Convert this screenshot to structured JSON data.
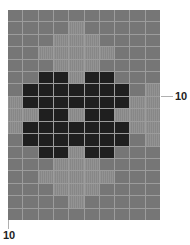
{
  "figure": {
    "rows": 17,
    "cols": 10,
    "colors": {
      "M": "#767676",
      "L": "#8c8c8c",
      "D": "#1f1f1f",
      "gridline": "#9c9c9c"
    },
    "legend": {
      "M": "medium gray",
      "L": "light gray",
      "D": "dark"
    },
    "cells": [
      "MMMMMMMMMM",
      "MMMMLMMMMM",
      "MMMLLLMMMM",
      "MMLLLLLMMM",
      "MMMLLLMMMM",
      "MMDDLDDMMM",
      "MDDDDDDDML",
      "LDDDDDDDLL",
      "LLDDLDDLLL",
      "LDDDDDDDLL",
      "MDDDDDDDML",
      "MMDDLDDMMM",
      "MMMLLLMMMM",
      "MMLLLLLMMM",
      "MMMLLLMMMM",
      "MMMMLMMMMM",
      "MMMMMMMMMM"
    ]
  },
  "labels": {
    "x_axis": "10",
    "y_axis": "10"
  }
}
